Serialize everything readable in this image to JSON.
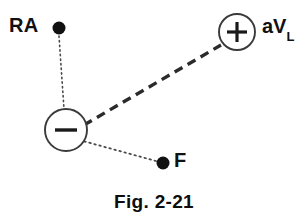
{
  "figure": {
    "caption": "Fig. 2-21",
    "background_color": "#ffffff",
    "ink_color": "#111111",
    "width": 308,
    "height": 223
  },
  "labels": {
    "ra": "RA",
    "f": "F",
    "avl_main": "aV",
    "avl_subscript": "L"
  },
  "nodes": [
    {
      "id": "ra-electrode",
      "label": "RA",
      "type": "filled-dot",
      "cx": 59,
      "cy": 28,
      "r": 6.5,
      "fill": "#111111"
    },
    {
      "id": "f-electrode",
      "label": "F",
      "type": "filled-dot",
      "cx": 163,
      "cy": 163,
      "r": 6.5,
      "fill": "#111111"
    },
    {
      "id": "negative-terminal",
      "label": "−",
      "type": "open-circle-minus",
      "cx": 66,
      "cy": 130,
      "r": 21,
      "stroke": "#3a3a3a",
      "fill": "#ffffff"
    },
    {
      "id": "positive-terminal",
      "label": "+",
      "type": "open-circle-plus",
      "cx": 237,
      "cy": 32,
      "r": 18,
      "stroke": "#3a3a3a",
      "fill": "#ffffff"
    }
  ],
  "connections": [
    {
      "id": "ra-to-negative",
      "style": "dotted",
      "from": "ra-electrode",
      "to": "negative-terminal",
      "x1": 59,
      "y1": 36,
      "x2": 64,
      "y2": 109,
      "stroke": "#4a4a4a",
      "width": 1.6
    },
    {
      "id": "f-to-negative",
      "style": "dotted",
      "from": "f-electrode",
      "to": "negative-terminal",
      "x1": 156,
      "y1": 161,
      "x2": 83,
      "y2": 141,
      "stroke": "#4a4a4a",
      "width": 1.6
    },
    {
      "id": "negative-to-positive",
      "style": "dashed",
      "from": "negative-terminal",
      "to": "positive-terminal",
      "x1": 84,
      "y1": 125,
      "x2": 221,
      "y2": 45,
      "stroke": "#2b2b2b",
      "width": 3.4
    }
  ]
}
